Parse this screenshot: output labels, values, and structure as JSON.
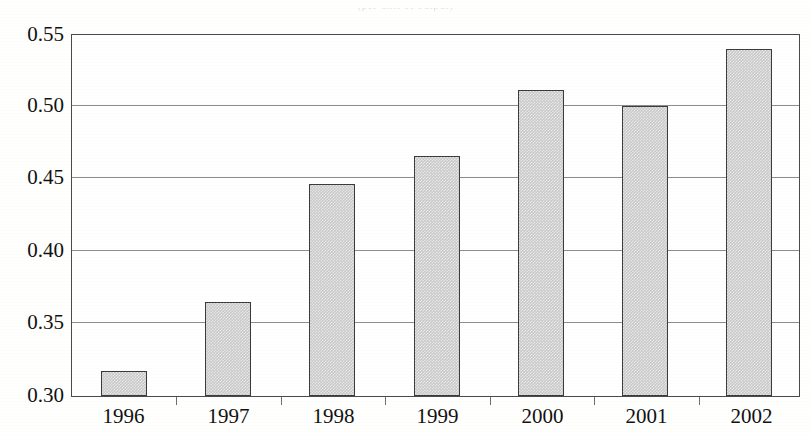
{
  "figure": {
    "title_remnant": "(per unit of output)",
    "background_color": "#ffffff"
  },
  "chart_data": {
    "type": "bar",
    "title": "",
    "subtitle": "",
    "xlabel": "",
    "ylabel": "",
    "categories": [
      "1996",
      "1997",
      "1998",
      "1999",
      "2000",
      "2001",
      "2002"
    ],
    "values": [
      0.317,
      0.365,
      0.446,
      0.465,
      0.511,
      0.5,
      0.539
    ],
    "series": [
      {
        "name": "",
        "values": [
          0.317,
          0.365,
          0.446,
          0.465,
          0.511,
          0.5,
          0.539
        ]
      }
    ],
    "ylim": [
      0.3,
      0.55
    ],
    "xlim": [
      "1996",
      "2002"
    ],
    "ytick_labels": [
      "0.55",
      "0.50",
      "0.45",
      "0.40",
      "0.35",
      "0.30"
    ],
    "ytick_values": [
      0.55,
      0.5,
      0.45,
      0.4,
      0.35,
      0.3
    ],
    "xtick_labels": [
      "1996",
      "1997",
      "1998",
      "1999",
      "2000",
      "2001",
      "2002"
    ],
    "grid": true,
    "grid_axis": "y",
    "legend": false,
    "legend_position": "none",
    "bar_fill_color": "#c9c9c9",
    "bar_edge_color": "#3b3b3b",
    "gridline_color": "#8d8d8d",
    "axis_color": "#4a4a4a"
  }
}
